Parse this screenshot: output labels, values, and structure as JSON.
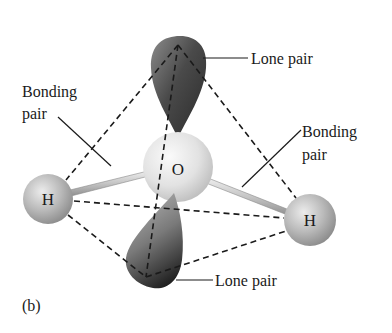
{
  "figure": {
    "panel_label": "(b)",
    "molecule": "H2O",
    "atoms": {
      "central": {
        "symbol": "O"
      },
      "left": {
        "symbol": "H"
      },
      "right": {
        "symbol": "H"
      }
    },
    "labels": {
      "top_lone_pair": "Lone pair",
      "bottom_lone_pair": "Lone pair",
      "left_bonding_pair_line1": "Bonding",
      "left_bonding_pair_line2": "pair",
      "right_bonding_pair_line1": "Bonding",
      "right_bonding_pair_line2": "pair"
    },
    "colors": {
      "background": "#ffffff",
      "lone_pair_lobe_dark": "#2b2b2b",
      "lone_pair_lobe_light": "#9a9a9a",
      "oxygen_sphere": "#e6e6e6",
      "hydrogen_sphere": "#b8b8b8",
      "bond_rod": "#c8c8c8",
      "line": "#1a1a1a"
    }
  }
}
